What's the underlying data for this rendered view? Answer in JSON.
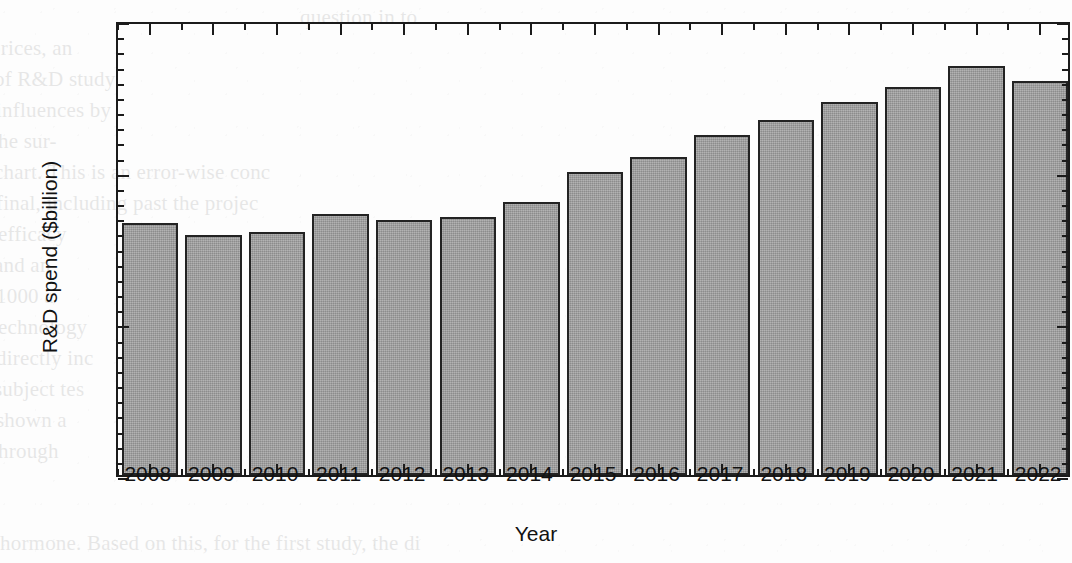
{
  "chart_data": {
    "type": "bar",
    "title": "",
    "xlabel": "Year",
    "ylabel": "R&D spend ($billion)",
    "categories": [
      "2008",
      "2009",
      "2010",
      "2011",
      "2012",
      "2013",
      "2014",
      "2015",
      "2016",
      "2017",
      "2018",
      "2019",
      "2020",
      "2021",
      "2022"
    ],
    "values": [
      133,
      129,
      130,
      136,
      134,
      135,
      140,
      150,
      155,
      162,
      167,
      173,
      178,
      185,
      180
    ],
    "ylim": [
      50,
      200
    ],
    "y_major_ticks": [
      50,
      100,
      150,
      200
    ],
    "y_major_tick_labels": [
      "50",
      "100",
      "150",
      "200"
    ],
    "y_minor_tick_step": 5,
    "grid": false,
    "legend": null,
    "bar_fill_color": "#9c9c9c",
    "bar_edge_color": "#232323",
    "axis_color": "#1b1b1b",
    "background_color": "#fdfdfd"
  },
  "page_background": {
    "bleed_through_lines": [
      "question in to",
      "prices, an",
      "of R&D study",
      "influences by",
      "the sur-",
      "chart. This is an error-wise conc",
      "final, including past the projec",
      "efficacy",
      "and an",
      "1000 a",
      "technology",
      "directly inc",
      "subject tes",
      "shown a",
      "through",
      "hormone. Based on this, for the first study, the di"
    ]
  }
}
